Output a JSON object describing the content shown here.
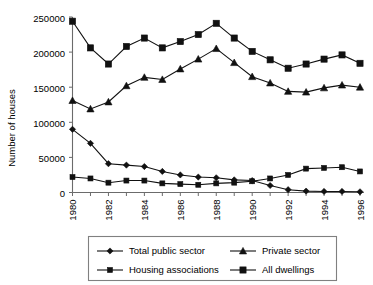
{
  "chart_data": {
    "type": "line",
    "title": "",
    "xlabel": "",
    "ylabel": "Number of houses",
    "x": [
      1980,
      1981,
      1982,
      1983,
      1984,
      1985,
      1986,
      1987,
      1988,
      1989,
      1990,
      1991,
      1992,
      1993,
      1994,
      1995,
      1996
    ],
    "categories": [
      "1980",
      "1981",
      "1982",
      "1983",
      "1984",
      "1985",
      "1986",
      "1987",
      "1988",
      "1989",
      "1990",
      "1991",
      "1992",
      "1993",
      "1994",
      "1995",
      "1996"
    ],
    "xtick_labels": [
      "1980",
      "1982",
      "1984",
      "1986",
      "1988",
      "1990",
      "1992",
      "1994",
      "1996"
    ],
    "xtick_values": [
      1980,
      1982,
      1984,
      1986,
      1988,
      1990,
      1992,
      1994,
      1996
    ],
    "ytick_labels": [
      "0",
      "50000",
      "100000",
      "150000",
      "200000",
      "250000"
    ],
    "ytick_values": [
      0,
      50000,
      100000,
      150000,
      200000,
      250000
    ],
    "ylim": [
      0,
      250000
    ],
    "xlim": [
      1980,
      1996
    ],
    "grid": false,
    "legend_position": "bottom",
    "series": [
      {
        "name": "Total public sector",
        "marker": "diamond",
        "values": [
          90000,
          70000,
          41000,
          39000,
          37000,
          30000,
          25000,
          22000,
          21000,
          18000,
          17000,
          10000,
          4000,
          2000,
          1500,
          1500,
          1000
        ]
      },
      {
        "name": "Private sector",
        "marker": "triangle",
        "values": [
          131000,
          119000,
          129000,
          152000,
          164000,
          161000,
          176000,
          190000,
          205000,
          185000,
          165000,
          156000,
          144000,
          143000,
          149000,
          153000,
          150000
        ]
      },
      {
        "name": "Housing associations",
        "marker": "square-small",
        "values": [
          22000,
          20000,
          14000,
          17000,
          17000,
          13000,
          12000,
          11000,
          13000,
          14000,
          16000,
          20000,
          25000,
          34000,
          35000,
          36000,
          30000
        ]
      },
      {
        "name": "All dwellings",
        "marker": "square",
        "values": [
          244000,
          206000,
          183000,
          208000,
          220000,
          206000,
          215000,
          225000,
          241000,
          220000,
          201000,
          189000,
          177000,
          183000,
          190000,
          196000,
          184000
        ]
      }
    ]
  },
  "legend": {
    "entries": [
      {
        "label": "Total public sector",
        "marker": "diamond"
      },
      {
        "label": "Private sector",
        "marker": "triangle"
      },
      {
        "label": "Housing associations",
        "marker": "square-small"
      },
      {
        "label": "All dwellings",
        "marker": "square"
      }
    ]
  }
}
